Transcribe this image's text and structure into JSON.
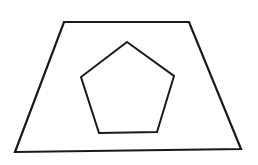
{
  "diagram": {
    "background": "#ffffff",
    "stroke_color": "#1a1a1a",
    "shapes": [
      {
        "name": "trapezoid",
        "type": "polygon",
        "stroke_width": 2.2,
        "points": [
          [
            64,
            22
          ],
          [
            189,
            22
          ],
          [
            241,
            149
          ],
          [
            15,
            152
          ]
        ]
      },
      {
        "name": "pentagon",
        "type": "polygon",
        "stroke_width": 2,
        "points": [
          [
            127,
            42
          ],
          [
            174,
            76
          ],
          [
            157,
            132
          ],
          [
            99,
            133
          ],
          [
            81,
            77
          ]
        ]
      }
    ]
  }
}
